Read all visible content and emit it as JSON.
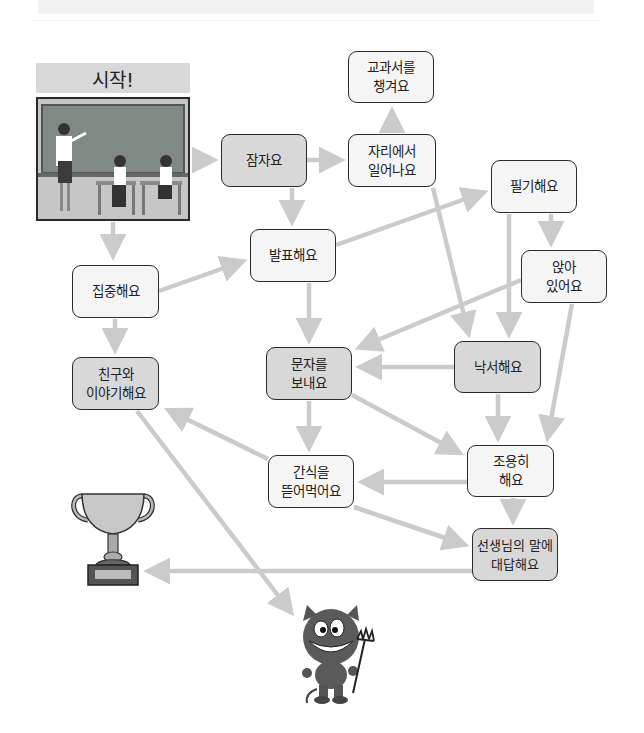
{
  "start": {
    "label": "시작!",
    "image": "classroom-scene"
  },
  "nodes": {
    "sleep": "잠자요",
    "pack_book": "교과서를\n챙겨요",
    "stand_up": "자리에서\n일어나요",
    "take_notes": "필기해요",
    "sit": "앉아\n있어요",
    "focus": "집중해요",
    "present": "발표해요",
    "chat_friend": "친구와\n이야기해요",
    "text_msg": "문자를\n보내요",
    "doodle": "낙서해요",
    "quiet": "조용히\n해요",
    "snack": "간식을\n뜯어먹어요",
    "answer_teacher": "선생님의 말에\n대답해요"
  },
  "goals": {
    "win": "trophy-icon",
    "lose": "devil-icon"
  },
  "colors": {
    "arrow": "#cbcbcb",
    "node_light": "#f5f5f5",
    "node_dark": "#d8d8d8",
    "border": "#2b2b2b"
  }
}
